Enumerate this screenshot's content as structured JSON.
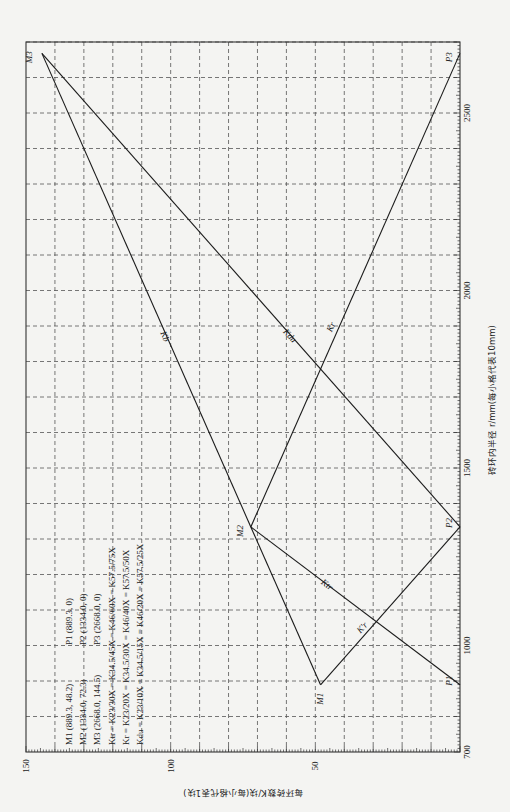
{
  "chart_data": {
    "type": "line",
    "orientation": "rotated-90-ccw",
    "title": "",
    "xlabel": "砖环内半径 r/mm(每小格代表10mm)",
    "ylabel": "每环砖数K/块(每小格代表1块)",
    "xlim": [
      700,
      2720
    ],
    "ylim": [
      0,
      150
    ],
    "x_ticks": [
      700,
      1000,
      1500,
      2000,
      2500
    ],
    "y_ticks": [
      50,
      100,
      150
    ],
    "x_grid_step": 100,
    "y_grid_step": 10,
    "x_minor_step": 10,
    "y_minor_step": 1,
    "grid": true,
    "points": {
      "M1": {
        "x": 889.3,
        "y": 48.2,
        "label": "M1"
      },
      "M2": {
        "x": 1334.0,
        "y": 72.3,
        "label": "M2"
      },
      "M3": {
        "x": 2668.0,
        "y": 144.5,
        "label": "M3"
      },
      "P1": {
        "x": 889.3,
        "y": 0,
        "label": "P1"
      },
      "P2": {
        "x": 1334.0,
        "y": 0,
        "label": "P2"
      },
      "P3": {
        "x": 2668.0,
        "y": 0,
        "label": "P3"
      }
    },
    "series": [
      {
        "name": "Ktr",
        "label": "Ktr",
        "x": [
          889.3,
          1334.0
        ],
        "y": [
          0,
          72.3
        ],
        "note": "P1→M2 (K_tr)"
      },
      {
        "name": "Ktr'",
        "label": "K'tr",
        "x": [
          889.3,
          1334.0
        ],
        "y": [
          48.2,
          0
        ],
        "note": "M1→P2"
      },
      {
        "name": "Kr",
        "label": "Kr",
        "x": [
          889.3,
          1334.0,
          2668.0
        ],
        "y": [
          48.2,
          72.3,
          144.5
        ],
        "note": "M1→M2→M3 (K_b along upper part)"
      },
      {
        "name": "Kb",
        "label": "Kb",
        "x": [
          1334.0,
          2668.0
        ],
        "y": [
          72.3,
          144.5
        ]
      },
      {
        "name": "Kdu",
        "label": "Kdu",
        "x": [
          1334.0,
          2668.0
        ],
        "y": [
          0,
          144.5
        ],
        "note": "P2→M3"
      },
      {
        "name": "Kr_desc",
        "label": "Kr",
        "x": [
          1334.0,
          2668.0
        ],
        "y": [
          72.3,
          0
        ],
        "note": "M2→P3"
      }
    ],
    "segments": [
      {
        "from": "P1",
        "to": "M2",
        "label": "Ktr",
        "label_at": 0.62
      },
      {
        "from": "M1",
        "to": "P2",
        "label": "K'r",
        "label_at": 0.35
      },
      {
        "from": "M1",
        "to": "M2",
        "label": "",
        "label_at": 0.5
      },
      {
        "from": "M2",
        "to": "M3",
        "label": "Kb",
        "label_at": 0.4
      },
      {
        "from": "P2",
        "to": "M3",
        "label": "Kdu",
        "label_at": 0.4
      },
      {
        "from": "M2",
        "to": "P3",
        "label": "Kr",
        "label_at": 0.42
      }
    ],
    "legend": {
      "position": "upper-left (rotated view: lower-left)",
      "lines": [
        "M1 (889.3, 48.2)      P1 (889.3, 0)",
        "M2 (1334.0, 72.3)     P2 (1334.0, 0)",
        "M3 (2668.0, 144.5)    P3 (2668.0, 0)",
        "Ktr = K23/30X = K34.5/45X = K46/60X = K57.5/75X",
        "Kr = K23/20X = K34.5/30X = K46/40X = K57.5/50X",
        "Kdu = K23/10X = K34.5/15X = K46/20X = K57.5/25X"
      ]
    }
  },
  "axes": {
    "x_title": "砖环内半径 r/mm(每小格代表10mm)",
    "y_title": "每环砖数K/块(每小格代表1块)"
  },
  "legend": {
    "col1": [
      "M1 (889.3, 48.2)",
      "M2 (1334.0, 72.3)",
      "M3 (2668.0, 144.5)"
    ],
    "col2": [
      "P1 (889.3, 0)",
      "P2 (1334.0, 0)",
      "P3 (2668.0, 0)"
    ],
    "eq": [
      "Ktr = K23/30X = K34.5/45X = K46/60X = K57.5/75X",
      "Kr = K23/20X = K34.5/30X = K46/40X = K57.5/50X",
      "Kdu = K23/10X = K34.5/15X = K46/20X = K57.5/25X"
    ]
  },
  "layout": {
    "frame": {
      "left": 26,
      "right": 460,
      "top": 42,
      "bottom": 752
    },
    "line_color": "#1a1a1a",
    "grid_color": "#555555",
    "background": "#f4f4f2"
  }
}
